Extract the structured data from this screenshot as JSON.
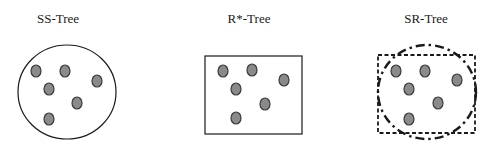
{
  "panels": [
    {
      "id": "ss-tree",
      "title": "SS-Tree",
      "title_pos": [
        58,
        23
      ],
      "bounding": {
        "type": "circle",
        "style": "solid",
        "cx": 67,
        "cy": 92,
        "rx": 49,
        "ry": 47
      },
      "points": [
        [
          36,
          71
        ],
        [
          65,
          71
        ],
        [
          97,
          81
        ],
        [
          49,
          89
        ],
        [
          77,
          103
        ],
        [
          49,
          119
        ]
      ]
    },
    {
      "id": "r-star-tree",
      "title": "R*-Tree",
      "title_pos": [
        249,
        23
      ],
      "bounding": {
        "type": "rect",
        "style": "solid",
        "x": 205,
        "y": 56,
        "width": 97,
        "height": 78
      },
      "points": [
        [
          223,
          71
        ],
        [
          252,
          70
        ],
        [
          284,
          80
        ],
        [
          236,
          89
        ],
        [
          265,
          104
        ],
        [
          236,
          118
        ]
      ]
    },
    {
      "id": "sr-tree",
      "title": "SR-Tree",
      "title_pos": [
        426,
        23
      ],
      "bounding": [
        {
          "type": "rect",
          "style": "dashed",
          "x": 378,
          "y": 55,
          "width": 97,
          "height": 78
        },
        {
          "type": "circle",
          "style": "dash-dot",
          "cx": 427,
          "cy": 92,
          "rx": 49,
          "ry": 47
        }
      ],
      "points": [
        [
          396,
          71
        ],
        [
          425,
          71
        ],
        [
          457,
          80
        ],
        [
          409,
          89
        ],
        [
          438,
          103
        ],
        [
          409,
          119
        ]
      ]
    }
  ],
  "colors": {
    "point_fill": "#8a8a8a",
    "point_stroke": "#3a3a3a",
    "outline": "#1a1a1a"
  }
}
